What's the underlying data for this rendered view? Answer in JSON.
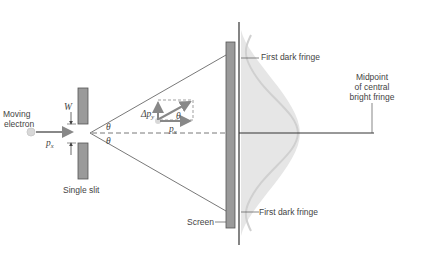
{
  "diagram": {
    "labels": {
      "moving_electron_line1": "Moving",
      "moving_electron_line2": "electron",
      "px_left": "p",
      "px_left_sub": "x",
      "width": "W",
      "theta_upper": "θ",
      "theta_lower": "θ",
      "single_slit": "Single slit",
      "delta_py": "Δp",
      "delta_py_sub": "y",
      "px_vector": "p",
      "px_vector_sub": "x",
      "theta_vector": "θ",
      "screen": "Screen",
      "first_dark_fringe_top": "First dark fringe",
      "first_dark_fringe_bottom": "First dark fringe",
      "midpoint_line1": "Midpoint",
      "midpoint_line2": "of central",
      "midpoint_line3": "bright fringe"
    },
    "colors": {
      "line": "#444444",
      "bar_fill": "#9a9a9a",
      "fringe_fill": "#e6e6e6",
      "fringe_edge": "#d0d0d0",
      "electron": "#d8d8d8",
      "arrow": "#888888"
    }
  }
}
